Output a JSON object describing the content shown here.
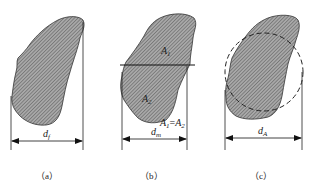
{
  "figure": {
    "panels": [
      {
        "id": "a",
        "caption": "（a）",
        "dimension_label": {
          "main": "d",
          "sub": "f"
        },
        "description": "Feret diameter: distance between two parallel tangents"
      },
      {
        "id": "b",
        "caption": "（b）",
        "dimension_label": {
          "main": "d",
          "sub": "m"
        },
        "area_labels": {
          "upper": {
            "main": "A",
            "sub": "1"
          },
          "lower": {
            "main": "A",
            "sub": "2"
          },
          "equation": {
            "left": "A",
            "left_sub": "1",
            "eq": "=",
            "right": "A",
            "right_sub": "2"
          }
        },
        "description": "Martin diameter: chord dividing projected area into two equal halves"
      },
      {
        "id": "c",
        "caption": "（c）",
        "dimension_label": {
          "main": "d",
          "sub": "A"
        },
        "description": "Projected-area diameter: circle of equal area (dashed)"
      }
    ],
    "colors": {
      "fill": "#9a9a9a",
      "hatch": "#555555",
      "outline": "#333333",
      "line": "#222222"
    }
  }
}
